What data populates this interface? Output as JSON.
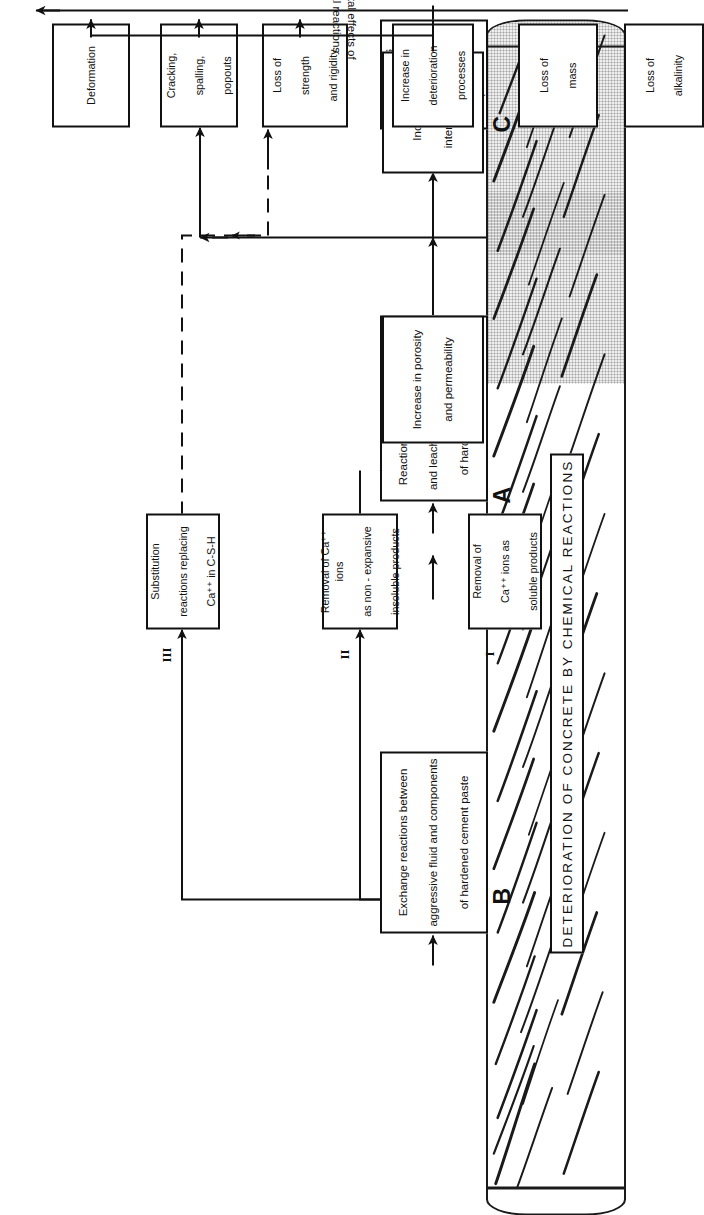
{
  "figure": {
    "title": "DETERIORATION OF CONCRETE BY CHEMICAL REACTIONS",
    "bracket_label_line1": "Detrimental effects of",
    "bracket_label_line2": "chemical reactions",
    "illustration": "concrete-specimen-cracked"
  },
  "groups": [
    {
      "letter": "A"
    },
    {
      "letter": "B"
    },
    {
      "letter": "C"
    }
  ],
  "romans": [
    {
      "label": "I"
    },
    {
      "label": "II"
    },
    {
      "label": "III"
    }
  ],
  "primary": {
    "c": {
      "line1": "Reactions involving",
      "line2": "formation of",
      "line3": "expansive products"
    },
    "a": {
      "line1": "Reactions involving hydrolysis",
      "line2": "and leaching of the components",
      "line3": "of hardened cement paste"
    },
    "b": {
      "line1": "Exchange reactions between",
      "line2": "aggressive fluid and components",
      "line3": "of hardened cement paste"
    }
  },
  "sub_b": {
    "i": {
      "line1": "Removal of",
      "line2": "Ca⁺⁺ ions as",
      "line3": "soluble products"
    },
    "ii": {
      "line1": "Removal of Ca⁺⁺ ions",
      "line2": "as non - expansive",
      "line3": "insoluble products"
    },
    "iii": {
      "line1": "Substitution",
      "line2": "reactions replacing",
      "line3": "Ca⁺⁺ in C-S-H"
    }
  },
  "intermediate": {
    "stress": {
      "line1": "Increase in",
      "line2": "internal stress"
    },
    "porosity": {
      "line1": "Increase in porosity",
      "line2": "and permeability"
    }
  },
  "effects": [
    {
      "line1": "Deformation",
      "line2": "",
      "line3": ""
    },
    {
      "line1": "Cracking,",
      "line2": "spalling,",
      "line3": "popouts"
    },
    {
      "line1": "Loss of",
      "line2": "strength",
      "line3": "and rigidity"
    },
    {
      "line1": "Increase in",
      "line2": "deterioration",
      "line3": "processes"
    },
    {
      "line1": "Loss of",
      "line2": "mass",
      "line3": ""
    },
    {
      "line1": "Loss of",
      "line2": "alkalinity",
      "line3": ""
    }
  ],
  "colors": {
    "ink": "#111111",
    "paper": "#ffffff",
    "specimen_shade": "#efefef"
  }
}
